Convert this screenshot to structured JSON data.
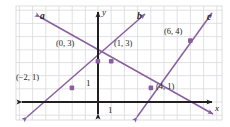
{
  "figure": {
    "type": "coordinate-graph",
    "background": "#ffffff",
    "grid_color": "#d9d9de",
    "axis_color": "#231f20",
    "line_color": "#8a5f9e",
    "point_color": "#8a5f9e",
    "text_color": "#231f20"
  },
  "axes": {
    "x_label": "x",
    "y_label": "y",
    "x_tick_label": "1",
    "y_tick_label": "1",
    "origin_px": {
      "x": 98,
      "y": 102
    },
    "unit_px": 13.2,
    "x_range": [
      -6.5,
      9.5
    ],
    "y_range": [
      -1.8,
      7.2
    ],
    "grid": true
  },
  "lines": [
    {
      "id": "a",
      "label": "a",
      "label_pos": {
        "x": 40,
        "y": 12
      },
      "slope": -0.5,
      "intercept": 3,
      "equation": "y = -1/2 x + 3",
      "color": "#8a5f9e"
    },
    {
      "id": "b",
      "label": "b",
      "label_pos": {
        "x": 137,
        "y": 12
      },
      "slope": 1,
      "intercept": 3,
      "equation": "y = x + 3",
      "color": "#8a5f9e"
    },
    {
      "id": "c",
      "label": "c",
      "label_pos": {
        "x": 207,
        "y": 13
      },
      "slope": 1.5,
      "intercept": -5,
      "equation": "y = 3/2 x - 5",
      "color": "#8a5f9e"
    }
  ],
  "points": [
    {
      "label": "(0, 3)",
      "x": 0,
      "y": 3,
      "label_pos": {
        "x": 56,
        "y": 39
      }
    },
    {
      "label": "(1, 3)",
      "x": 1,
      "y": 3,
      "label_pos": {
        "x": 114,
        "y": 39
      }
    },
    {
      "label": "(−2, 1)",
      "x": -2,
      "y": 1,
      "label_pos": {
        "x": 16,
        "y": 73
      }
    },
    {
      "label": "(4, 1)",
      "x": 4,
      "y": 1,
      "label_pos": {
        "x": 156,
        "y": 82
      }
    },
    {
      "label": "(6, 4)",
      "x": 6,
      "y": 4,
      "label_pos": {
        "x": 164,
        "y": 27
      }
    }
  ],
  "tick_labels": [
    {
      "text": "1",
      "axis": "y",
      "pos": {
        "x": 86,
        "y": 79
      }
    },
    {
      "text": "1",
      "axis": "x",
      "pos": {
        "x": 108,
        "y": 106
      }
    }
  ],
  "axis_labels": [
    {
      "text": "y",
      "pos": {
        "x": 102,
        "y": 8
      }
    },
    {
      "text": "x",
      "pos": {
        "x": 216,
        "y": 104
      }
    }
  ]
}
